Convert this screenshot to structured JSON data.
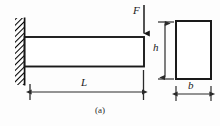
{
  "figure": {
    "caption": "(a)",
    "type": "engineering-diagram",
    "colors": {
      "line": "#1a1a1a",
      "dimension": "#3a3a3a",
      "background": "#fdfdfd",
      "hatch": "#000000"
    },
    "labels": {
      "force": "F",
      "length": "L",
      "height": "h",
      "width": "b"
    },
    "elements": {
      "wall": "fixed-support-hatched",
      "beam": "horizontal-rectangle",
      "load_arrow": "downward-arrow",
      "cross_section": "rectangle"
    }
  },
  "geometry": {
    "wall": {
      "x": 15,
      "y": 18,
      "w": 10,
      "h": 67
    },
    "beam": {
      "x": 25,
      "y": 37,
      "w": 119,
      "h": 29
    },
    "force_arrow": {
      "x": 144,
      "y1": 5,
      "y2": 37
    },
    "force_label": {
      "x": 134,
      "y": 5
    },
    "length_dim": {
      "x1": 30,
      "x2": 143,
      "y": 92
    },
    "length_label": {
      "x": 83,
      "y": 78
    },
    "section_rect": {
      "x": 176,
      "y": 21,
      "w": 35,
      "h": 58
    },
    "height_dim": {
      "x": 165,
      "y1": 22,
      "y2": 79
    },
    "height_label": {
      "x": 154,
      "y": 43
    },
    "width_dim": {
      "x1": 176,
      "x2": 211,
      "y": 94
    },
    "width_label": {
      "x": 189,
      "y": 81
    },
    "caption_pos": {
      "x": 96,
      "y": 107
    }
  }
}
